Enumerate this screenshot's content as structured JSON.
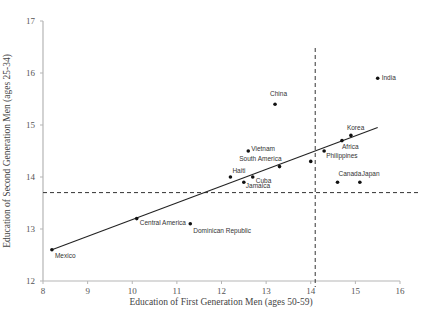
{
  "chart_data": {
    "type": "scatter",
    "title": "",
    "xlabel": "Education of First Generation Men (ages 50-59)",
    "ylabel": "Education of Second Generation Men (ages 25-34)",
    "xlim": [
      8,
      16
    ],
    "ylim": [
      12,
      17
    ],
    "xticks": [
      8,
      9,
      10,
      11,
      12,
      13,
      14,
      15,
      16
    ],
    "yticks": [
      12,
      13,
      14,
      15,
      16,
      17
    ],
    "grid": false,
    "legend": null,
    "points": [
      {
        "label": "Mexico",
        "x": 8.2,
        "y": 12.6
      },
      {
        "label": "Central America",
        "x": 10.1,
        "y": 13.2
      },
      {
        "label": "Dominican Republic",
        "x": 11.3,
        "y": 13.1
      },
      {
        "label": "Haiti",
        "x": 12.2,
        "y": 14.0
      },
      {
        "label": "Jamaica",
        "x": 12.5,
        "y": 13.9
      },
      {
        "label": "Vietnam",
        "x": 12.6,
        "y": 14.5
      },
      {
        "label": "Cuba",
        "x": 12.7,
        "y": 14.0
      },
      {
        "label": "China",
        "x": 13.2,
        "y": 15.4
      },
      {
        "label": "South America",
        "x": 13.3,
        "y": 14.2
      },
      {
        "label": "",
        "x": 14.0,
        "y": 14.3
      },
      {
        "label": "Philippines",
        "x": 14.3,
        "y": 14.5
      },
      {
        "label": "Canada",
        "x": 14.6,
        "y": 13.9
      },
      {
        "label": "Africa",
        "x": 14.7,
        "y": 14.7
      },
      {
        "label": "Korea",
        "x": 14.9,
        "y": 14.8
      },
      {
        "label": "Japan",
        "x": 15.1,
        "y": 13.9
      },
      {
        "label": "India",
        "x": 15.5,
        "y": 15.9
      }
    ],
    "trendline": {
      "x": [
        8.2,
        15.5
      ],
      "y": [
        12.6,
        14.95
      ]
    },
    "reference_lines": {
      "vertical_dashed_x": 14.1,
      "horizontal_dashed_y": 13.7
    }
  }
}
